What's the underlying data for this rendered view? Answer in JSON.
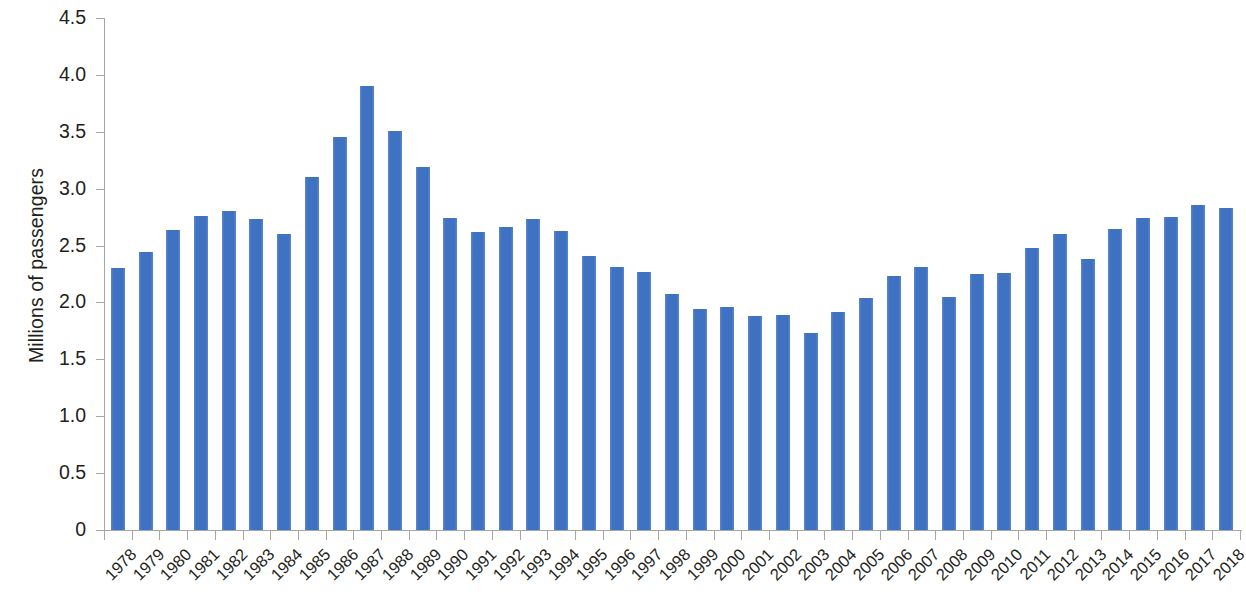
{
  "chart_data": {
    "type": "bar",
    "title": "",
    "subtitle": "",
    "xlabel": "",
    "ylabel": "Millions of passengers",
    "ylim": [
      0,
      4.5
    ],
    "ytick_labels": [
      "4.5",
      "4.0",
      "3.5",
      "3.0",
      "2.5",
      "2.0",
      "1.5",
      "1.0",
      "0.5",
      "0"
    ],
    "ytick_values": [
      4.5,
      4.0,
      3.5,
      3.0,
      2.5,
      2.0,
      1.5,
      1.0,
      0.5,
      0
    ],
    "grid": false,
    "legend": "none",
    "series_color": "#4575c4",
    "categories": [
      "1978",
      "1979",
      "1980",
      "1981",
      "1982",
      "1983",
      "1984",
      "1985",
      "1986",
      "1987",
      "1988",
      "1989",
      "1990",
      "1991",
      "1992",
      "1993",
      "1994",
      "1995",
      "1996",
      "1997",
      "1998",
      "1999",
      "2000",
      "2001",
      "2002",
      "2003",
      "2004",
      "2005",
      "2006",
      "2007",
      "2008",
      "2009",
      "2010",
      "2011",
      "2012",
      "2013",
      "2014",
      "2015",
      "2016",
      "2017",
      "2018"
    ],
    "values": [
      2.3,
      2.44,
      2.64,
      2.76,
      2.8,
      2.73,
      2.6,
      3.1,
      3.45,
      3.9,
      3.51,
      3.19,
      2.74,
      2.62,
      2.66,
      2.73,
      2.63,
      2.41,
      2.31,
      2.27,
      2.07,
      1.94,
      1.96,
      1.88,
      1.89,
      1.73,
      1.92,
      2.04,
      2.23,
      2.31,
      2.05,
      2.25,
      2.26,
      2.48,
      2.6,
      2.38,
      2.65,
      2.74,
      2.75,
      2.86,
      2.83
    ]
  },
  "axis": {
    "y_title": "Millions of passengers"
  }
}
